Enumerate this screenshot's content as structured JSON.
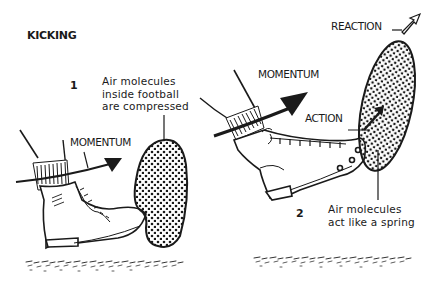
{
  "title": "KICKING",
  "panel1": {
    "number": "1",
    "note_lines": [
      "Air molecules",
      "inside football",
      "are compressed"
    ],
    "momentum_label": "MOMENTUM"
  },
  "panel2": {
    "number": "2",
    "momentum_label": "MOMENTUM",
    "action_label": "ACTION",
    "reaction_label": "REACTION",
    "note_lines": [
      "Air molecules",
      "act like a spring"
    ]
  },
  "colors": {
    "ink": "#1a1a1a",
    "background": "#ffffff"
  }
}
